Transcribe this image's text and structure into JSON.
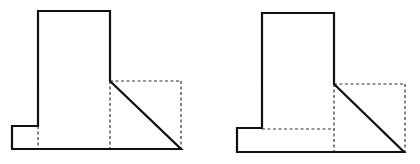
{
  "diagram": {
    "colors": {
      "stroke": "#111111",
      "dashed": "#333333",
      "background": "#ffffff"
    },
    "figures": [
      {
        "id": "left",
        "outline": [
          [
            38,
            11
          ],
          [
            110,
            11
          ],
          [
            110,
            81
          ],
          [
            181,
            149
          ],
          [
            12,
            149
          ],
          [
            12,
            126
          ],
          [
            38,
            126
          ],
          [
            38,
            11
          ]
        ],
        "dashed_lines": [
          [
            [
              38,
              126
            ],
            [
              38,
              149
            ]
          ],
          [
            [
              110,
              81
            ],
            [
              110,
              149
            ]
          ],
          [
            [
              110,
              81
            ],
            [
              181,
              81
            ]
          ],
          [
            [
              181,
              81
            ],
            [
              181,
              149
            ]
          ]
        ]
      },
      {
        "id": "right",
        "outline": [
          [
            262,
            13
          ],
          [
            334,
            13
          ],
          [
            334,
            84
          ],
          [
            404,
            152
          ],
          [
            237,
            152
          ],
          [
            237,
            128
          ],
          [
            262,
            128
          ],
          [
            262,
            13
          ]
        ],
        "dashed_lines": [
          [
            [
              262,
              129
            ],
            [
              334,
              129
            ]
          ],
          [
            [
              334,
              84
            ],
            [
              334,
              152
            ]
          ],
          [
            [
              334,
              84
            ],
            [
              405,
              84
            ]
          ],
          [
            [
              405,
              84
            ],
            [
              405,
              152
            ]
          ]
        ]
      }
    ]
  }
}
